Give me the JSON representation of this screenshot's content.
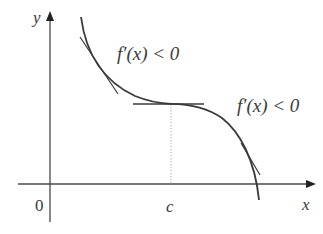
{
  "diagram": {
    "type": "function-graph",
    "axes": {
      "x_label": "x",
      "y_label": "y",
      "origin_label": "0"
    },
    "points": {
      "c_label": "c"
    },
    "annotations": [
      {
        "text": "f′(x) < 0",
        "position": "upper-left"
      },
      {
        "text": "f′(x) < 0",
        "position": "right"
      }
    ],
    "tangent_lines": [
      {
        "name": "left-tangent",
        "slope": "negative"
      },
      {
        "name": "horizontal-tangent",
        "slope": "zero",
        "at": "c"
      },
      {
        "name": "right-tangent",
        "slope": "negative"
      }
    ],
    "colors": {
      "curve": "#3a3a3a",
      "axis": "#4a4a4a",
      "dotted": "#9a9a9a",
      "text": "#3a3a3a"
    }
  }
}
